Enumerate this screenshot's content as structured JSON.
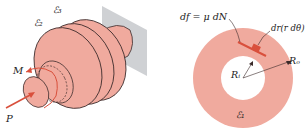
{
  "colors": {
    "body": "#f0aa9e",
    "body_stroke": "#3a2a2a",
    "wall": "#cfd1d4",
    "arrow": "#d9503c",
    "element": "#d9503c",
    "text": "#222222"
  },
  "left_figure": {
    "labels": {
      "e3": "ℰ₃",
      "e2": "ℰ₂",
      "moment": "M",
      "force": "P"
    }
  },
  "right_figure": {
    "labels": {
      "friction": "df = μ dN",
      "element": "dr(r dθ)",
      "inner_radius": "Rᵢ",
      "outer_radius": "Rₒ",
      "surface": "ℰ₁"
    }
  }
}
